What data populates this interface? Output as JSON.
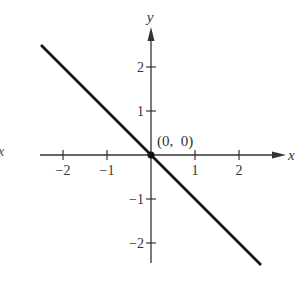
{
  "chart_data": {
    "type": "line",
    "title": "",
    "xlabel": "x",
    "ylabel": "y",
    "xlim": [
      -2.5,
      2.5
    ],
    "ylim": [
      -2.5,
      2.5
    ],
    "grid": false,
    "x_ticks": [
      -2,
      -1,
      1,
      2
    ],
    "x_tick_labels": [
      "−2",
      "−1",
      "1",
      "2"
    ],
    "y_ticks": [
      2,
      1,
      -1,
      -2
    ],
    "y_tick_labels": [
      "2",
      "1",
      "−1",
      "−2"
    ],
    "series": [
      {
        "name": "y = -x",
        "x": [
          -2.5,
          2.5
        ],
        "y": [
          2.5,
          -2.5
        ],
        "color": "#111111"
      }
    ],
    "points": [
      {
        "x": 0,
        "y": 0,
        "label": "(0,  0)"
      }
    ],
    "stray_label": "x"
  }
}
